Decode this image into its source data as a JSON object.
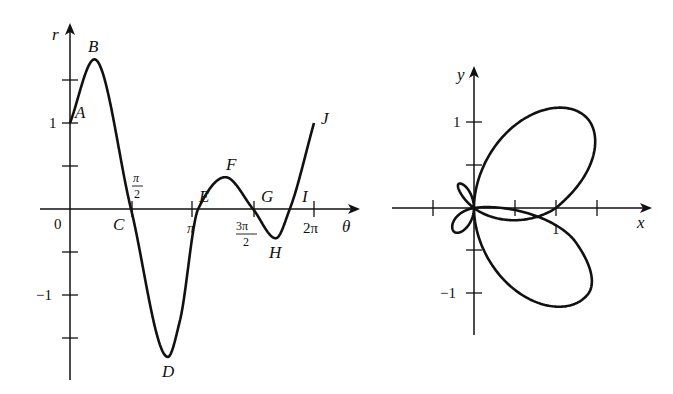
{
  "chart_data": [
    {
      "type": "line",
      "title": "",
      "xlabel": "θ",
      "ylabel": "r",
      "x_ticks": [
        "0",
        "π/2",
        "π",
        "3π/2",
        "2π"
      ],
      "y_ticks": [
        "−1",
        "1"
      ],
      "y_minor_ticks": [
        -1.5,
        -0.5,
        0.5,
        1.5
      ],
      "grid": false,
      "series": [
        {
          "name": "r(θ)",
          "theta": [
            0,
            0.63,
            1.5708,
            2.52,
            2.83,
            3.3,
            4.0,
            4.7124,
            5.3,
            5.66,
            6.2832
          ],
          "r": [
            1.0,
            1.74,
            0.0,
            -1.72,
            -1.3,
            0.0,
            0.37,
            0.0,
            -0.34,
            0.0,
            1.0
          ]
        }
      ],
      "points": [
        {
          "label": "A",
          "theta": 0,
          "r": 1.0
        },
        {
          "label": "B",
          "theta": 0.63,
          "r": 1.74
        },
        {
          "label": "C",
          "theta": 1.5708,
          "r": 0
        },
        {
          "label": "D",
          "theta": 2.52,
          "r": -1.72
        },
        {
          "label": "E",
          "theta": 3.3,
          "r": 0
        },
        {
          "label": "F",
          "theta": 4.0,
          "r": 0.37
        },
        {
          "label": "G",
          "theta": 4.7124,
          "r": 0
        },
        {
          "label": "H",
          "theta": 5.3,
          "r": -0.34
        },
        {
          "label": "I",
          "theta": 5.66,
          "r": 0
        },
        {
          "label": "J",
          "theta": 6.2832,
          "r": 1.0
        }
      ]
    },
    {
      "type": "line",
      "title": "",
      "xlabel": "x",
      "ylabel": "y",
      "x_ticks": [
        "1"
      ],
      "y_ticks": [
        "1",
        "−1"
      ],
      "x_minor_ticks": [
        -0.5,
        0.5,
        1.5
      ],
      "y_minor_ticks": [
        -0.5,
        0.5
      ],
      "grid": false,
      "description": "Polar curve traced by r(θ) from the left graph, shown in Cartesian coordinates",
      "series": [
        {
          "name": "polar curve",
          "from": "r(θ) of chart 0"
        }
      ]
    }
  ],
  "labels": {
    "left": {
      "r_axis": "r",
      "theta_axis": "θ",
      "zero": "0",
      "one": "1",
      "minus_one": "−1",
      "pi_half_num": "π",
      "pi_half_den": "2",
      "pi": "π",
      "three_pi_half_num": "3π",
      "three_pi_half_den": "2",
      "two_pi": "2π",
      "A": "A",
      "B": "B",
      "C": "C",
      "D": "D",
      "E": "E",
      "F": "F",
      "G": "G",
      "H": "H",
      "I": "I",
      "J": "J"
    },
    "right": {
      "x_axis": "x",
      "y_axis": "y",
      "one_x": "1",
      "one_y": "1",
      "minus_one_y": "−1"
    }
  },
  "colors": {
    "ink": "#111111",
    "background": "#ffffff"
  }
}
